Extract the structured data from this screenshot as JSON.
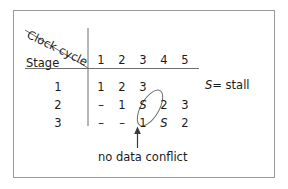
{
  "figure": {
    "diagonal_header": "Clock cycle",
    "row_header": "Stage",
    "caption": "no data conflict",
    "legend": {
      "symbol": "S",
      "equals": "=",
      "meaning": "stall",
      "full": "S = stall"
    },
    "colors": {
      "frame": "#9a9a9a",
      "ink": "#1b1b1b",
      "rule": "#6e6e6e",
      "background": "#ffffff"
    }
  },
  "table": {
    "columns": [
      "1",
      "2",
      "3",
      "4",
      "5"
    ],
    "rows": [
      {
        "stage": "1",
        "cells": [
          "1",
          "2",
          "3",
          "",
          ""
        ]
      },
      {
        "stage": "2",
        "cells": [
          "–",
          "1",
          "S",
          "2",
          "3"
        ]
      },
      {
        "stage": "3",
        "cells": [
          "–",
          "–",
          "1",
          "S",
          "2"
        ]
      }
    ]
  },
  "annotations": {
    "ellipse": {
      "encircles": [
        "row2-col4",
        "row3-col3"
      ],
      "shape": "tilted-ellipse"
    },
    "arrow": {
      "points_to": "row3-col3",
      "direction": "up"
    }
  }
}
